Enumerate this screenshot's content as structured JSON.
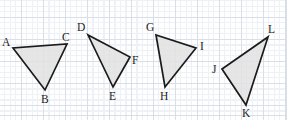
{
  "figure": {
    "canvas": {
      "width": 287,
      "height": 120
    },
    "grid": {
      "minor_spacing_px": 5.5,
      "major_spacing_px": 22,
      "minor_color": "#eef1f6",
      "major_color": "#d9dfe8",
      "background_color": "#ffffff"
    },
    "style": {
      "fill_color": "#e2e2e2",
      "stroke_color": "#1b1b1b",
      "stroke_width": 1.7,
      "label_color": "#1c1c1c",
      "label_font_size": 11.5
    },
    "triangles": [
      {
        "name": "triangle-abc",
        "points": "13,48 45,90 67,44",
        "vertices": [
          {
            "label": "A",
            "x": 13,
            "y": 48,
            "label_x": 2,
            "label_y": 46
          },
          {
            "label": "B",
            "x": 45,
            "y": 90,
            "label_x": 41,
            "label_y": 103
          },
          {
            "label": "C",
            "x": 67,
            "y": 44,
            "label_x": 62,
            "label_y": 41
          }
        ]
      },
      {
        "name": "triangle-def",
        "points": "88,35 113,87 130,57",
        "vertices": [
          {
            "label": "D",
            "x": 88,
            "y": 35,
            "label_x": 77,
            "label_y": 31
          },
          {
            "label": "E",
            "x": 113,
            "y": 87,
            "label_x": 109,
            "label_y": 100
          },
          {
            "label": "F",
            "x": 130,
            "y": 57,
            "label_x": 132,
            "label_y": 64
          }
        ]
      },
      {
        "name": "triangle-ghi",
        "points": "156,35 165,87 196,48",
        "vertices": [
          {
            "label": "G",
            "x": 156,
            "y": 35,
            "label_x": 146,
            "label_y": 31
          },
          {
            "label": "H",
            "x": 165,
            "y": 87,
            "label_x": 160,
            "label_y": 100
          },
          {
            "label": "I",
            "x": 196,
            "y": 48,
            "label_x": 200,
            "label_y": 50
          }
        ]
      },
      {
        "name": "triangle-jkl",
        "points": "222,69 246,105 268,37",
        "vertices": [
          {
            "label": "J",
            "x": 222,
            "y": 69,
            "label_x": 212,
            "label_y": 73
          },
          {
            "label": "K",
            "x": 246,
            "y": 105,
            "label_x": 242,
            "label_y": 117
          },
          {
            "label": "L",
            "x": 268,
            "y": 37,
            "label_x": 268,
            "label_y": 33
          }
        ]
      }
    ]
  }
}
